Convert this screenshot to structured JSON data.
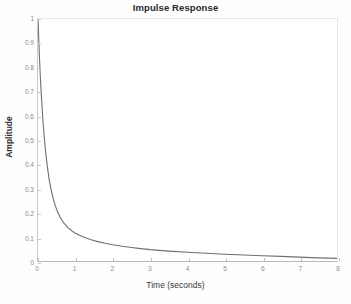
{
  "chart_data": {
    "type": "line",
    "title": "Impulse Response",
    "xlabel": "Time (seconds)",
    "ylabel": "Amplitude",
    "xlim": [
      0,
      8
    ],
    "ylim": [
      0,
      1
    ],
    "grid": false,
    "legend": null,
    "line_color": "#6e6e76",
    "xticks": [
      "0",
      "1",
      "2",
      "3",
      "4",
      "5",
      "6",
      "7",
      "8"
    ],
    "xtick_values": [
      0,
      1,
      2,
      3,
      4,
      5,
      6,
      7,
      8
    ],
    "yticks": [
      "0",
      "0.1",
      "0.2",
      "0.3",
      "0.4",
      "0.5",
      "0.6",
      "0.7",
      "0.8",
      "0.9",
      "1"
    ],
    "ytick_values": [
      0,
      0.1,
      0.2,
      0.3,
      0.4,
      0.5,
      0.6,
      0.7,
      0.8,
      0.9,
      1
    ],
    "series": [
      {
        "name": "Impulse Response",
        "x": [
          0,
          0.02,
          0.04,
          0.06,
          0.08,
          0.1,
          0.13,
          0.16,
          0.2,
          0.25,
          0.3,
          0.35,
          0.4,
          0.45,
          0.5,
          0.6,
          0.7,
          0.8,
          0.9,
          1.0,
          1.1,
          1.2,
          1.4,
          1.6,
          1.8,
          2.0,
          2.25,
          2.5,
          2.75,
          3.0,
          3.5,
          4.0,
          4.5,
          5.0,
          5.5,
          6.0,
          6.5,
          7.0,
          7.5,
          8.0
        ],
        "y": [
          1.0,
          0.92,
          0.84,
          0.77,
          0.71,
          0.66,
          0.585,
          0.525,
          0.455,
          0.39,
          0.335,
          0.295,
          0.262,
          0.235,
          0.212,
          0.179,
          0.155,
          0.138,
          0.125,
          0.115,
          0.107,
          0.1,
          0.089,
          0.08,
          0.073,
          0.067,
          0.061,
          0.056,
          0.051,
          0.047,
          0.041,
          0.036,
          0.032,
          0.028,
          0.025,
          0.022,
          0.019,
          0.016,
          0.013,
          0.011
        ]
      }
    ]
  }
}
